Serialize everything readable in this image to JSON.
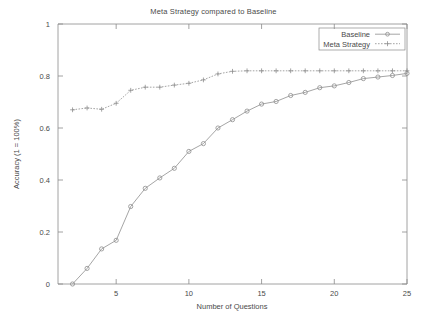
{
  "chart_data": {
    "type": "line",
    "title": "Meta Strategy compared to Baseline",
    "xlabel": "Number of Questions",
    "ylabel": "Accuracy (1 = 100%)",
    "xlim": [
      1,
      25
    ],
    "ylim": [
      0,
      1
    ],
    "grid": false,
    "legend_position": "top-right",
    "xticks": [
      5,
      10,
      15,
      20,
      25
    ],
    "xtick_labels": [
      "5",
      "10",
      "15",
      "20",
      "25"
    ],
    "yticks": [
      0,
      0.2,
      0.4,
      0.6,
      0.8,
      1
    ],
    "ytick_labels": [
      "0",
      "0.2",
      "0.4",
      "0.6",
      "0.8",
      "1"
    ],
    "x": [
      2,
      3,
      4,
      5,
      6,
      7,
      8,
      9,
      10,
      11,
      12,
      13,
      14,
      15,
      16,
      17,
      18,
      19,
      20,
      21,
      22,
      23,
      24,
      25
    ],
    "series": [
      {
        "name": "Baseline",
        "marker": "circle",
        "linestyle": "solid",
        "color": "#8e8e8e",
        "values": [
          0.0,
          0.06,
          0.135,
          0.168,
          0.298,
          0.368,
          0.408,
          0.445,
          0.51,
          0.54,
          0.6,
          0.632,
          0.665,
          0.692,
          0.702,
          0.725,
          0.737,
          0.755,
          0.762,
          0.775,
          0.79,
          0.796,
          0.802,
          0.81
        ]
      },
      {
        "name": "Meta Strategy",
        "marker": "plus",
        "linestyle": "dotted",
        "color": "#8e8e8e",
        "values": [
          0.67,
          0.677,
          0.672,
          0.695,
          0.745,
          0.757,
          0.757,
          0.765,
          0.772,
          0.785,
          0.808,
          0.818,
          0.82,
          0.82,
          0.82,
          0.82,
          0.82,
          0.82,
          0.82,
          0.82,
          0.82,
          0.82,
          0.82,
          0.82
        ]
      }
    ]
  },
  "axes": {
    "title": "Meta Strategy compared to Baseline",
    "x_title": "Number of Questions",
    "y_title": "Accuracy (1 = 100%)"
  },
  "legend": {
    "entries": [
      {
        "label": "Baseline"
      },
      {
        "label": "Meta Strategy"
      }
    ]
  }
}
